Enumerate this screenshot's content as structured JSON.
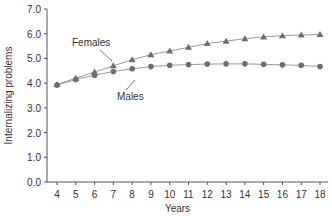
{
  "chart_data": {
    "type": "line",
    "title": "",
    "xlabel": "Years",
    "ylabel": "Internalizing problems",
    "x": [
      4,
      5,
      6,
      7,
      8,
      9,
      10,
      11,
      12,
      13,
      14,
      15,
      16,
      17,
      18
    ],
    "ylim": [
      0,
      7
    ],
    "yticks": [
      "0.0",
      "1.0",
      "2.0",
      "3.0",
      "4.0",
      "5.0",
      "6.0",
      "7.0"
    ],
    "grid": false,
    "series": [
      {
        "name": "Females",
        "marker": "triangle",
        "values": [
          3.95,
          4.2,
          4.45,
          4.7,
          4.95,
          5.15,
          5.3,
          5.45,
          5.6,
          5.7,
          5.8,
          5.87,
          5.92,
          5.95,
          5.97
        ]
      },
      {
        "name": "Males",
        "marker": "circle",
        "values": [
          3.92,
          4.15,
          4.32,
          4.47,
          4.58,
          4.67,
          4.72,
          4.75,
          4.77,
          4.78,
          4.78,
          4.76,
          4.74,
          4.72,
          4.67
        ]
      }
    ],
    "annotations": [
      {
        "text": "Females",
        "x": 6,
        "y": 5.7
      },
      {
        "text": "Males",
        "x": 8,
        "y": 3.4
      }
    ]
  },
  "colors": {
    "line": "#9a9a9a",
    "marker": "#6e6e6e",
    "axis": "#555555"
  }
}
